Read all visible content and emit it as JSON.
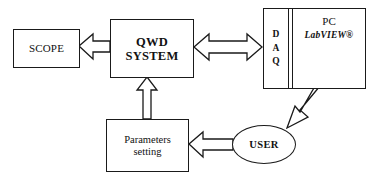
{
  "diagram": {
    "background_color": "#ffffff",
    "line_color": "#1a1a1a",
    "nodes": {
      "scope": {
        "label": "SCOPE",
        "shape": "rectangle"
      },
      "qwd_system": {
        "label": "QWD\nSYSTEM",
        "shape": "rectangle"
      },
      "daq": {
        "label": "D\nA\nQ",
        "shape": "rectangle"
      },
      "pc": {
        "label": "PC",
        "sub_label": "LabVIEW®",
        "shape": "rectangle"
      },
      "parameters_setting": {
        "label": "Parameters\nsetting",
        "shape": "rectangle"
      },
      "user": {
        "label": "USER",
        "shape": "ellipse"
      }
    },
    "connections": [
      {
        "from": "qwd_system",
        "to": "scope",
        "style": "hollow-block-arrow",
        "direction": "left"
      },
      {
        "from": "qwd_system",
        "to": "daq",
        "style": "hollow-block-arrow",
        "direction": "bidirectional"
      },
      {
        "from": "parameters_setting",
        "to": "qwd_system",
        "style": "hollow-block-arrow",
        "direction": "up"
      },
      {
        "from": "user",
        "to": "parameters_setting",
        "style": "hollow-block-arrow",
        "direction": "left"
      },
      {
        "from": "pc",
        "to": "user",
        "style": "thin-hollow-arrow",
        "direction": "diagonal-down-left"
      }
    ]
  }
}
